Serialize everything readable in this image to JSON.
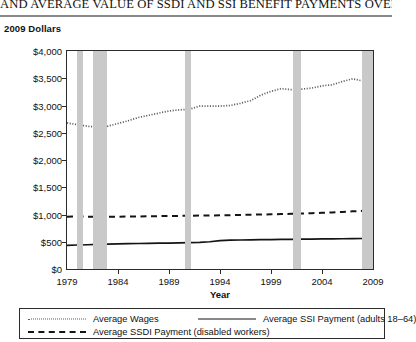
{
  "title": {
    "text": "AND AVERAGE VALUE OF SSDI AND SSI BENEFIT PAYMENTS OVER TIME"
  },
  "axis_caption": "2009 Dollars",
  "legend": {
    "items": [
      {
        "label": "Average Wages",
        "style": "dotted"
      },
      {
        "label": "Average SSI Payment (adults 18–64)",
        "style": "solid"
      },
      {
        "label": "Average SSDI Payment (disabled workers)",
        "style": "dashed"
      }
    ]
  },
  "chart_data": {
    "type": "line",
    "title": "AND AVERAGE VALUE OF SSDI AND SSI BENEFIT PAYMENTS OVER TIME",
    "xlabel": "Year",
    "ylabel": "2009 Dollars",
    "xlim": [
      1979,
      2009
    ],
    "ylim": [
      0,
      4000
    ],
    "grid": false,
    "legend_position": "bottom",
    "xticks": [
      1979,
      1984,
      1989,
      1994,
      1999,
      2004,
      2009
    ],
    "xtick_labels": [
      "1979",
      "1984",
      "1989",
      "1994",
      "1999",
      "2004",
      "2009"
    ],
    "yticks": [
      0,
      500,
      1000,
      1500,
      2000,
      2500,
      3000,
      3500,
      4000
    ],
    "ytick_labels": [
      "$0",
      "$500",
      "$1,000",
      "$1,500",
      "$2,000",
      "$2,500",
      "$3,000",
      "$3,500",
      "$4,000"
    ],
    "x": [
      1979,
      1980,
      1981,
      1982,
      1983,
      1984,
      1985,
      1986,
      1987,
      1988,
      1989,
      1990,
      1991,
      1992,
      1993,
      1994,
      1995,
      1996,
      1997,
      1998,
      1999,
      2000,
      2001,
      2002,
      2003,
      2004,
      2005,
      2006,
      2007,
      2008,
      2009
    ],
    "series": [
      {
        "name": "Average Wages",
        "style": "dotted",
        "color": "#5c5c5c",
        "values": [
          2680,
          2650,
          2620,
          2600,
          2620,
          2670,
          2720,
          2780,
          2820,
          2860,
          2900,
          2920,
          2930,
          2990,
          2990,
          2990,
          3000,
          3040,
          3090,
          3190,
          3260,
          3310,
          3290,
          3300,
          3320,
          3360,
          3380,
          3440,
          3490,
          3450,
          3400
        ]
      },
      {
        "name": "Average SSI Payment (adults 18–64)",
        "style": "solid",
        "color": "#141414",
        "values": [
          435,
          440,
          445,
          450,
          455,
          460,
          465,
          468,
          470,
          473,
          476,
          480,
          483,
          487,
          500,
          520,
          528,
          532,
          535,
          538,
          540,
          542,
          545,
          548,
          550,
          552,
          553,
          555,
          557,
          560,
          565
        ]
      },
      {
        "name": "Average SSDI Payment (disabled workers)",
        "style": "dashed",
        "color": "#141414",
        "values": [
          960,
          965,
          960,
          955,
          958,
          960,
          962,
          965,
          968,
          970,
          972,
          975,
          978,
          980,
          983,
          985,
          988,
          992,
          996,
          1000,
          1004,
          1008,
          1012,
          1018,
          1024,
          1030,
          1038,
          1048,
          1058,
          1068,
          1080
        ]
      }
    ],
    "recession_bands": [
      {
        "start": 1980.0,
        "end": 1980.55
      },
      {
        "start": 1981.5,
        "end": 1982.9
      },
      {
        "start": 1990.55,
        "end": 1991.2
      },
      {
        "start": 2001.2,
        "end": 2001.9
      },
      {
        "start": 2007.95,
        "end": 2009.0
      }
    ],
    "band_color": "#c9c9c9"
  }
}
